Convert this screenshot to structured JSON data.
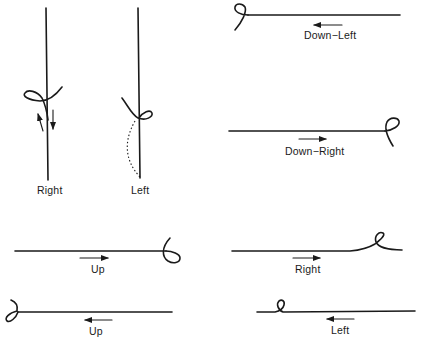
{
  "figure": {
    "type": "line-knot / flourish direction diagram",
    "panels": [
      {
        "id": "vertical-right",
        "label": "Right",
        "orientation": "vertical",
        "loop_side": "left",
        "arrows": [
          "up",
          "down"
        ]
      },
      {
        "id": "vertical-left",
        "label": "Left",
        "orientation": "vertical",
        "loop_side": "right",
        "dotted_path": true
      },
      {
        "id": "down-left",
        "label": "Down−Left",
        "orientation": "horizontal",
        "loop_end": "left",
        "arrow": "left"
      },
      {
        "id": "down-right",
        "label": "Down−Right",
        "orientation": "horizontal",
        "loop_end": "right",
        "arrow": "right"
      },
      {
        "id": "up-right",
        "label": "Up",
        "orientation": "horizontal",
        "loop_end": "right",
        "arrow": "right"
      },
      {
        "id": "up-left",
        "label": "Up",
        "orientation": "horizontal",
        "loop_end": "left",
        "arrow": "left"
      },
      {
        "id": "right",
        "label": "Right",
        "orientation": "horizontal",
        "loop_end": "right-inline",
        "arrow": "right"
      },
      {
        "id": "left",
        "label": "Left",
        "orientation": "horizontal",
        "loop_end": "left-inline",
        "arrow": "left"
      }
    ],
    "colors": {
      "ink": "#1a1a1a",
      "background": "#ffffff"
    }
  }
}
